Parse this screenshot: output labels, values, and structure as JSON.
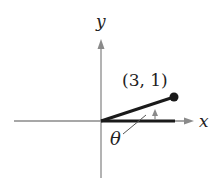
{
  "axes": {
    "x_label": "x",
    "y_label": "y",
    "axis_color": "#8a8a8a"
  },
  "point": {
    "label": "(3, 1)",
    "x": 3,
    "y": 1
  },
  "angle": {
    "label": "θ"
  },
  "colors": {
    "segment": "#1a1a1a",
    "axis": "#8a8a8a",
    "text": "#222222"
  }
}
